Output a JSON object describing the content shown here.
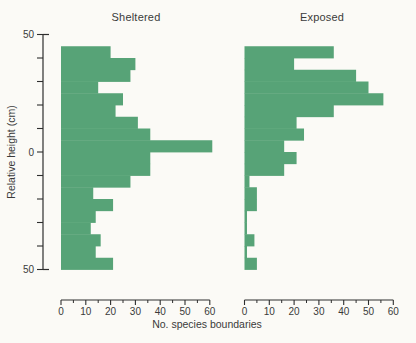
{
  "figure": {
    "background_color": "#fbfaf6",
    "bar_color": "#57a377",
    "axis_color": "#2e2e2e",
    "text_color": "#3a3a3a"
  },
  "chart_data": {
    "type": "bar",
    "orientation": "horizontal_bars",
    "xlabel": "No. species boundaries",
    "ylabel": "Relative height (cm)",
    "xlim": [
      0,
      60
    ],
    "ylim": [
      -50,
      50
    ],
    "x_major_ticks": [
      0,
      10,
      20,
      30,
      40,
      50,
      60
    ],
    "x_minor_ticks": [
      5,
      15,
      25,
      35,
      45,
      55
    ],
    "y_tick_interval": 10,
    "y_axis_labeled_ticks": [
      {
        "value": 50,
        "label": "50"
      },
      {
        "value": 0,
        "label": "0"
      },
      {
        "value": -50,
        "label": "50"
      }
    ],
    "bin_height_cm": 5,
    "bin_top_cm": 45,
    "grid": false,
    "legend": "none",
    "panels": [
      {
        "title": "Sheltered",
        "bin_top_edges_cm": [
          45,
          40,
          35,
          30,
          25,
          20,
          15,
          10,
          5,
          0,
          -5,
          -10,
          -15,
          -20,
          -25,
          -30,
          -35,
          -40,
          -45
        ],
        "values": [
          20,
          30,
          28,
          15,
          25,
          22,
          31,
          36,
          61,
          36,
          36,
          28,
          13,
          21,
          14,
          12,
          16,
          14,
          21
        ]
      },
      {
        "title": "Exposed",
        "bin_top_edges_cm": [
          45,
          40,
          35,
          30,
          25,
          20,
          15,
          10,
          5,
          0,
          -5,
          -10,
          -15,
          -20,
          -25,
          -30,
          -35,
          -40,
          -45
        ],
        "values": [
          36,
          20,
          45,
          50,
          56,
          36,
          21,
          24,
          16,
          21,
          16,
          2,
          5,
          5,
          1,
          1,
          4,
          1,
          5
        ]
      }
    ]
  }
}
